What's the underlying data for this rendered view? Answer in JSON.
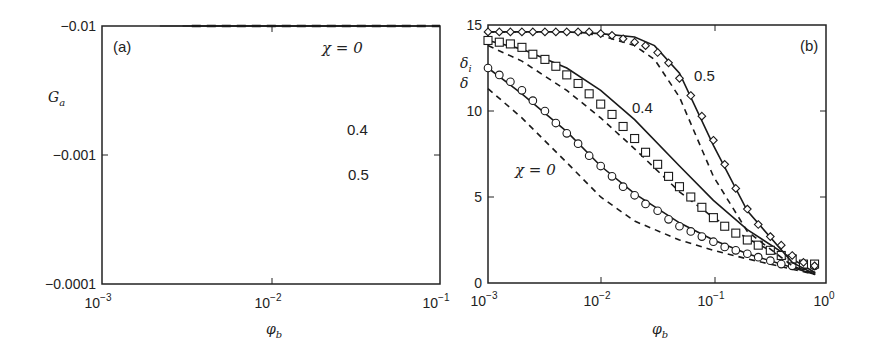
{
  "figure": {
    "panels": [
      {
        "id": "a",
        "panel_label": "(a)",
        "ylabel_main": "G",
        "ylabel_sub": "a",
        "xlabel_main": "φ",
        "xlabel_sub": "b",
        "y_ticks": [
          "−0.01",
          "−0.001",
          "−0.0001"
        ],
        "x_ticks": [
          {
            "base": "10",
            "exp": "−3"
          },
          {
            "base": "10",
            "exp": "−2"
          },
          {
            "base": "10",
            "exp": "−1"
          }
        ],
        "annotations": {
          "chi0": "χ = 0",
          "chi04": "0.4",
          "chi05": "0.5"
        }
      },
      {
        "id": "b",
        "panel_label": "(b)",
        "ylabel_top_main": "δ",
        "ylabel_top_sub": "i",
        "ylabel_bottom": "δ",
        "xlabel_main": "φ",
        "xlabel_sub": "b",
        "y_ticks": [
          "15",
          "10",
          "5",
          "0"
        ],
        "x_ticks": [
          {
            "base": "10",
            "exp": "−3"
          },
          {
            "base": "10",
            "exp": "−2"
          },
          {
            "base": "10",
            "exp": "−1"
          },
          {
            "base": "10",
            "exp": "0"
          }
        ],
        "annotations": {
          "chi0": "χ = 0",
          "chi04": "0.4",
          "chi05": "0.5"
        }
      }
    ]
  },
  "chart_data": [
    {
      "type": "line",
      "title": "(a)",
      "xlabel": "φ_b",
      "ylabel": "G_a",
      "xscale": "log",
      "yscale": "log (negative values)",
      "xlim": [
        0.001,
        0.1
      ],
      "ylim": [
        -0.0001,
        -0.01
      ],
      "grid": false,
      "legend": "inline annotations",
      "series": [
        {
          "name": "χ = 0 (solid)",
          "style": "solid",
          "x": [
            0.0022,
            0.0035,
            0.006,
            0.01,
            0.02,
            0.04,
            0.062
          ],
          "y": [
            -0.0001,
            -0.00017,
            -0.00033,
            -0.00063,
            -0.0015,
            -0.0037,
            -0.01
          ]
        },
        {
          "name": "χ = 0 (symbols, circles)",
          "marker": "circle",
          "x": [
            0.0025,
            0.0031,
            0.0039,
            0.0049,
            0.0062,
            0.0078,
            0.0098,
            0.0124,
            0.0156,
            0.0196,
            0.0247,
            0.031,
            0.039,
            0.049,
            0.062
          ],
          "y": [
            -0.00012,
            -0.00015,
            -0.0002,
            -0.00025,
            -0.00031,
            -0.00039,
            -0.0005,
            -0.00065,
            -0.00085,
            -0.0011,
            -0.0014,
            -0.0018,
            -0.0024,
            -0.0031,
            -0.0042
          ]
        },
        {
          "name": "χ = 0.4 (solid)",
          "style": "solid",
          "x": [
            0.003,
            0.005,
            0.01,
            0.02,
            0.04,
            0.08
          ],
          "y": [
            -0.0001,
            -0.00017,
            -0.00037,
            -0.00085,
            -0.002,
            -0.01
          ]
        },
        {
          "name": "χ = 0.4 (symbols, squares)",
          "marker": "square",
          "x": [
            0.0031,
            0.0039,
            0.0049,
            0.0062,
            0.0078,
            0.0098,
            0.0124,
            0.0156,
            0.0196,
            0.0247,
            0.031,
            0.039,
            0.049,
            0.062,
            0.078
          ],
          "y": [
            -0.0001,
            -0.00012,
            -0.00015,
            -0.0002,
            -0.00025,
            -0.00032,
            -0.00042,
            -0.00055,
            -0.0007,
            -0.00092,
            -0.0012,
            -0.0016,
            -0.0021,
            -0.0029,
            -0.0085
          ]
        },
        {
          "name": "χ = 0.5 (solid)",
          "style": "solid",
          "x": [
            0.0034,
            0.006,
            0.01,
            0.02,
            0.04,
            0.1
          ],
          "y": [
            -0.0001,
            -0.00016,
            -0.00026,
            -0.00055,
            -0.0012,
            -0.006
          ]
        },
        {
          "name": "χ = 0.5 (symbols, diamonds)",
          "marker": "diamond",
          "x": [
            0.0039,
            0.0049,
            0.0062,
            0.0078,
            0.0098,
            0.0124,
            0.0156,
            0.0196,
            0.0247,
            0.031,
            0.039,
            0.049,
            0.062,
            0.078,
            0.098
          ],
          "y": [
            -0.00011,
            -0.00013,
            -0.00016,
            -0.0002,
            -0.00024,
            -0.0003,
            -0.00037,
            -0.00046,
            -0.00058,
            -0.00073,
            -0.001,
            -0.0014,
            -0.002,
            -0.003,
            -0.0065
          ]
        },
        {
          "name": "χ = 0.5 (dashed)",
          "style": "dashed",
          "x": [
            0.0034,
            0.01,
            0.03,
            0.05,
            0.1
          ],
          "y": [
            -0.0001,
            -0.00026,
            -0.0007,
            -0.0012,
            -0.005
          ]
        }
      ],
      "annotations": [
        "(a)",
        "χ = 0",
        "0.4",
        "0.5"
      ]
    },
    {
      "type": "line",
      "title": "(b)",
      "xlabel": "φ_b",
      "ylabel": "δ_i, δ",
      "xscale": "log",
      "xlim": [
        0.001,
        1
      ],
      "ylim": [
        0,
        15
      ],
      "y_ticks": [
        0,
        5,
        10,
        15
      ],
      "grid": false,
      "legend": "inline annotations",
      "series": [
        {
          "name": "χ = 0 δ_i (solid)",
          "style": "solid",
          "x": [
            0.001,
            0.002,
            0.005,
            0.01,
            0.02,
            0.05,
            0.1,
            0.2,
            0.5,
            0.8
          ],
          "y": [
            12.5,
            11.0,
            8.8,
            6.8,
            5.2,
            3.5,
            2.5,
            1.7,
            0.9,
            0.5
          ]
        },
        {
          "name": "χ = 0 δ (dashed)",
          "style": "dashed",
          "x": [
            0.001,
            0.002,
            0.005,
            0.01,
            0.02,
            0.05,
            0.1,
            0.2,
            0.5,
            0.8
          ],
          "y": [
            11.3,
            9.6,
            7.0,
            5.0,
            3.6,
            2.5,
            1.9,
            1.4,
            0.8,
            0.5
          ]
        },
        {
          "name": "χ = 0 (circles)",
          "marker": "circle",
          "x": [
            0.001,
            0.00126,
            0.00158,
            0.002,
            0.0025,
            0.0032,
            0.004,
            0.005,
            0.0063,
            0.0079,
            0.01,
            0.0126,
            0.0158,
            0.02,
            0.025,
            0.032,
            0.04,
            0.05,
            0.063,
            0.079,
            0.1,
            0.126,
            0.158,
            0.2,
            0.25,
            0.32,
            0.4,
            0.5,
            0.63,
            0.79
          ],
          "y": [
            12.5,
            12.1,
            11.7,
            11.2,
            10.6,
            10.0,
            9.3,
            8.7,
            8.1,
            7.4,
            6.8,
            6.2,
            5.6,
            5.1,
            4.6,
            4.2,
            3.7,
            3.3,
            3.0,
            2.7,
            2.4,
            2.1,
            1.9,
            1.7,
            1.5,
            1.3,
            1.1,
            1.0,
            1.0,
            1.0
          ]
        },
        {
          "name": "χ = 0.4 δ_i (solid)",
          "style": "solid",
          "x": [
            0.001,
            0.002,
            0.005,
            0.01,
            0.02,
            0.05,
            0.1,
            0.2,
            0.5,
            0.8
          ],
          "y": [
            14.1,
            13.6,
            12.5,
            11.2,
            9.5,
            6.8,
            4.8,
            3.1,
            1.4,
            0.6
          ]
        },
        {
          "name": "χ = 0.4 δ (dashed)",
          "style": "dashed",
          "x": [
            0.001,
            0.002,
            0.005,
            0.01,
            0.02,
            0.05,
            0.1,
            0.2,
            0.5,
            0.8
          ],
          "y": [
            13.8,
            12.9,
            11.2,
            9.6,
            7.8,
            5.3,
            3.8,
            2.6,
            1.2,
            0.6
          ]
        },
        {
          "name": "χ = 0.4 (squares)",
          "marker": "square",
          "x": [
            0.001,
            0.00126,
            0.00158,
            0.002,
            0.0025,
            0.0032,
            0.004,
            0.005,
            0.0063,
            0.0079,
            0.01,
            0.0126,
            0.0158,
            0.02,
            0.025,
            0.032,
            0.04,
            0.05,
            0.063,
            0.079,
            0.1,
            0.126,
            0.158,
            0.2,
            0.25,
            0.32,
            0.4,
            0.5,
            0.63,
            0.79
          ],
          "y": [
            14.1,
            14.0,
            13.9,
            13.7,
            13.3,
            13.0,
            12.6,
            12.1,
            11.6,
            11.0,
            10.4,
            9.8,
            9.1,
            8.4,
            7.6,
            6.9,
            6.2,
            5.6,
            5.0,
            4.4,
            3.8,
            3.3,
            2.9,
            2.5,
            2.2,
            1.9,
            1.6,
            1.4,
            1.1,
            1.1
          ]
        },
        {
          "name": "χ = 0.5 δ_i (solid)",
          "style": "solid",
          "x": [
            0.001,
            0.005,
            0.01,
            0.02,
            0.03,
            0.05,
            0.1,
            0.2,
            0.5,
            0.8
          ],
          "y": [
            14.6,
            14.6,
            14.5,
            14.3,
            13.8,
            12.2,
            8.0,
            4.2,
            1.2,
            0.5
          ]
        },
        {
          "name": "χ = 0.5 δ (dashed)",
          "style": "dashed",
          "x": [
            0.001,
            0.005,
            0.01,
            0.02,
            0.03,
            0.05,
            0.1,
            0.2,
            0.5,
            0.8
          ],
          "y": [
            14.6,
            14.6,
            14.4,
            13.8,
            13.0,
            10.8,
            6.2,
            3.0,
            1.0,
            0.5
          ]
        },
        {
          "name": "χ = 0.5 (diamonds)",
          "marker": "diamond",
          "x": [
            0.001,
            0.00126,
            0.00158,
            0.002,
            0.0025,
            0.0032,
            0.004,
            0.005,
            0.0063,
            0.0079,
            0.01,
            0.0126,
            0.0158,
            0.02,
            0.025,
            0.032,
            0.04,
            0.05,
            0.063,
            0.079,
            0.1,
            0.126,
            0.158,
            0.2,
            0.25,
            0.32,
            0.4,
            0.5,
            0.63,
            0.79
          ],
          "y": [
            14.6,
            14.6,
            14.6,
            14.6,
            14.6,
            14.6,
            14.6,
            14.6,
            14.6,
            14.6,
            14.5,
            14.4,
            14.2,
            14.0,
            13.8,
            13.4,
            12.8,
            11.9,
            10.9,
            9.7,
            8.3,
            6.9,
            5.5,
            4.3,
            3.4,
            2.7,
            2.2,
            1.6,
            1.2,
            1.0
          ]
        }
      ],
      "annotations": [
        "(b)",
        "χ = 0",
        "0.4",
        "0.5"
      ]
    }
  ]
}
